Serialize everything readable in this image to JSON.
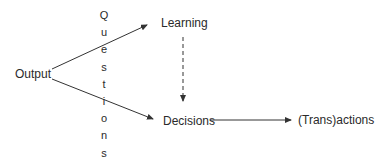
{
  "diagram": {
    "nodes": {
      "output": "Output",
      "learning": "Learning",
      "decisions": "Decisions",
      "transactions": "(Trans)actions"
    },
    "vertical_label": {
      "text": "Questions",
      "letters": [
        "Q",
        "u",
        "e",
        "s",
        "t",
        "i",
        "o",
        "n",
        "s"
      ]
    },
    "edges": [
      {
        "from": "Output",
        "to": "Learning",
        "style": "solid"
      },
      {
        "from": "Output",
        "to": "Decisions",
        "style": "solid"
      },
      {
        "from": "Learning",
        "to": "Decisions",
        "style": "dashed"
      },
      {
        "from": "Decisions",
        "to": "(Trans)actions",
        "style": "solid"
      }
    ],
    "colors": {
      "line": "#333333",
      "text": "#2a2a2a",
      "background": "#ffffff"
    }
  }
}
